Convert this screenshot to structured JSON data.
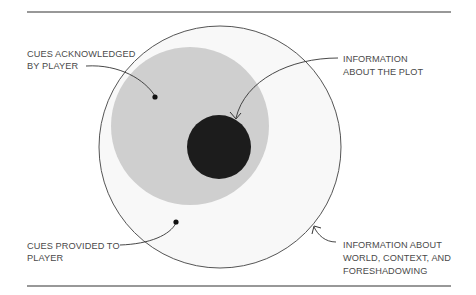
{
  "diagram": {
    "colors": {
      "outer_fill": "#f8f8f8",
      "outer_stroke": "#555555",
      "acknowledged_fill": "#cfcfcf",
      "plot_fill": "#1c1c1c",
      "rule": "#333333",
      "text": "#4a4a4a"
    },
    "labels": {
      "cues_acknowledged": [
        "CUES ACKNOWLEDGED",
        "BY PLAYER"
      ],
      "information_plot": [
        "INFORMATION",
        "ABOUT THE PLOT"
      ],
      "cues_provided": [
        "CUES PROVIDED TO",
        "PLAYER"
      ],
      "information_world": [
        "INFORMATION ABOUT",
        "WORLD, CONTEXT, AND",
        "FORESHADOWING"
      ]
    }
  }
}
